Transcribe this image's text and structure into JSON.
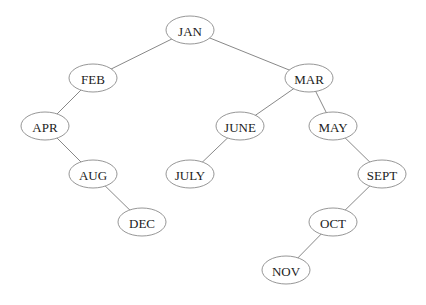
{
  "diagram": {
    "type": "binary-search-tree",
    "nodes": [
      {
        "id": "JAN",
        "label": "JAN"
      },
      {
        "id": "FEB",
        "label": "FEB"
      },
      {
        "id": "MAR",
        "label": "MAR"
      },
      {
        "id": "APR",
        "label": "APR"
      },
      {
        "id": "JUNE",
        "label": "JUNE"
      },
      {
        "id": "MAY",
        "label": "MAY"
      },
      {
        "id": "AUG",
        "label": "AUG"
      },
      {
        "id": "JULY",
        "label": "JULY"
      },
      {
        "id": "SEPT",
        "label": "SEPT"
      },
      {
        "id": "DEC",
        "label": "DEC"
      },
      {
        "id": "OCT",
        "label": "OCT"
      },
      {
        "id": "NOV",
        "label": "NOV"
      }
    ],
    "edges": [
      {
        "from": "JAN",
        "to": "FEB"
      },
      {
        "from": "JAN",
        "to": "MAR"
      },
      {
        "from": "FEB",
        "to": "APR"
      },
      {
        "from": "APR",
        "to": "AUG"
      },
      {
        "from": "AUG",
        "to": "DEC"
      },
      {
        "from": "MAR",
        "to": "JUNE"
      },
      {
        "from": "MAR",
        "to": "MAY"
      },
      {
        "from": "JUNE",
        "to": "JULY"
      },
      {
        "from": "MAY",
        "to": "SEPT"
      },
      {
        "from": "SEPT",
        "to": "OCT"
      },
      {
        "from": "OCT",
        "to": "NOV"
      }
    ]
  }
}
